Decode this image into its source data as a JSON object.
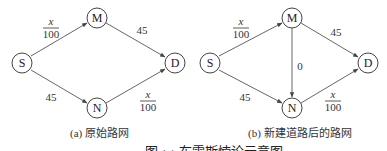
{
  "figure": {
    "subfigures": [
      {
        "id": "a",
        "caption": "(a) 原始路网",
        "nodes": [
          {
            "id": "S",
            "label": "S",
            "x": 22,
            "y": 63
          },
          {
            "id": "M",
            "label": "M",
            "x": 97,
            "y": 18
          },
          {
            "id": "D",
            "label": "D",
            "x": 175,
            "y": 63
          },
          {
            "id": "N",
            "label": "N",
            "x": 97,
            "y": 108
          }
        ],
        "edges": [
          {
            "from": "S",
            "to": "M",
            "cost": "x/100"
          },
          {
            "from": "M",
            "to": "D",
            "cost": "45"
          },
          {
            "from": "S",
            "to": "N",
            "cost": "45"
          },
          {
            "from": "N",
            "to": "D",
            "cost": "x/100"
          }
        ],
        "labels": {
          "sm_num": "x",
          "sm_den": "100",
          "md": "45",
          "sn": "45",
          "nd_num": "x",
          "nd_den": "100"
        }
      },
      {
        "id": "b",
        "caption": "(b) 新建道路后的路网",
        "nodes": [
          {
            "id": "S",
            "label": "S",
            "x": 210,
            "y": 63
          },
          {
            "id": "M",
            "label": "M",
            "x": 292,
            "y": 18
          },
          {
            "id": "D",
            "label": "D",
            "x": 368,
            "y": 63
          },
          {
            "id": "N",
            "label": "N",
            "x": 292,
            "y": 108
          }
        ],
        "edges": [
          {
            "from": "S",
            "to": "M",
            "cost": "x/100"
          },
          {
            "from": "M",
            "to": "D",
            "cost": "45"
          },
          {
            "from": "S",
            "to": "N",
            "cost": "45"
          },
          {
            "from": "N",
            "to": "D",
            "cost": "x/100"
          },
          {
            "from": "M",
            "to": "N",
            "cost": "0"
          }
        ],
        "labels": {
          "sm_num": "x",
          "sm_den": "100",
          "md": "45",
          "sn": "45",
          "mn": "0",
          "nd_num": "x",
          "nd_den": "100"
        }
      }
    ],
    "figure_caption": "图 · · 布雷斯悖论示意图"
  }
}
